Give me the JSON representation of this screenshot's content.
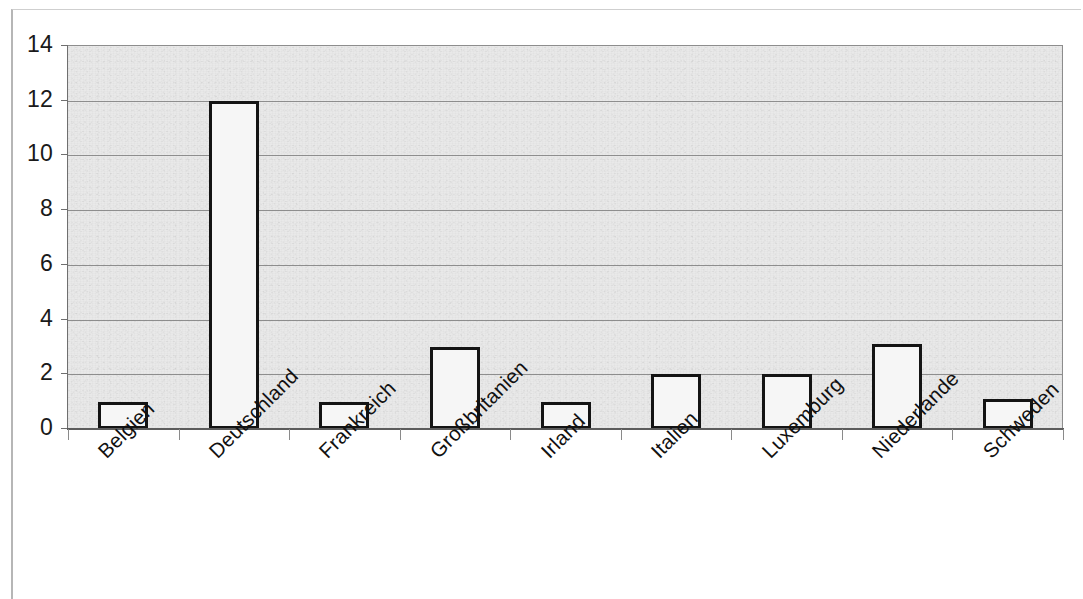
{
  "chart_data": {
    "type": "bar",
    "title": "",
    "subtitle": "",
    "xlabel": "",
    "ylabel": "",
    "categories": [
      "Belgien",
      "Deutschland",
      "Frankreich",
      "Großbritanien",
      "Irland",
      "Italien",
      "Luxemburg",
      "Niederlande",
      "Schweden"
    ],
    "values": [
      1,
      12,
      1,
      3,
      1,
      2,
      2,
      3.1,
      1.1
    ],
    "ylim": [
      0,
      14
    ],
    "y_ticks": [
      0,
      2,
      4,
      6,
      8,
      10,
      12,
      14
    ],
    "y_tick_labels": [
      "0",
      "2",
      "4",
      "6",
      "8",
      "10",
      "12",
      "14"
    ],
    "grid": true,
    "grid_axis": "y",
    "legend": false,
    "legend_position": "none",
    "bar_fill_color": "#f6f6f6",
    "bar_border_color": "#141414",
    "plot_background_color": "#e9e9e9",
    "gridline_color": "#7e7e7e",
    "axis_color": "#5c5c5c",
    "label_rotation_degrees": -45
  },
  "figure": {
    "background_color": "#ffffff",
    "frame_color": "#b6b6b6"
  }
}
